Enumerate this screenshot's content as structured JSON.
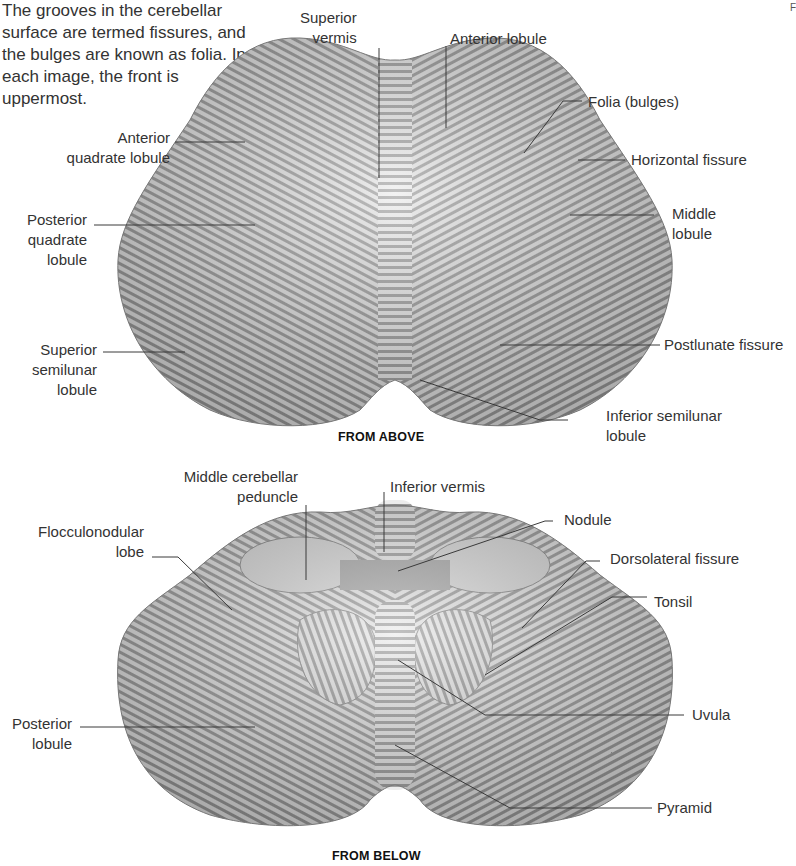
{
  "intro_text": "The grooves in the cerebellar surface are termed fissures, and the bulges are known as folia. In each image, the front is uppermost.",
  "intro_lines": [
    "The grooves in the cerebellar",
    "surface are termed fissures, and",
    "the bulges are known as folia. In",
    "each image, the front is",
    "uppermost."
  ],
  "corner_mark": "F",
  "from_above": {
    "caption": "FROM ABOVE",
    "labels": {
      "superior_vermis": [
        "Superior",
        "vermis"
      ],
      "anterior_lobule": "Anterior lobule",
      "folia": "Folia (bulges)",
      "horizontal_fissure": "Horizontal fissure",
      "middle_lobule": [
        "Middle",
        "lobule"
      ],
      "postlunate_fissure": "Postlunate fissure",
      "inferior_semilunar_lobule": [
        "Inferior semilunar",
        "lobule"
      ],
      "anterior_quadrate_lobule": [
        "Anterior",
        "quadrate lobule"
      ],
      "posterior_quadrate_lobule": [
        "Posterior",
        "quadrate",
        "lobule"
      ],
      "superior_semilunar_lobule": [
        "Superior",
        "semilunar",
        "lobule"
      ]
    }
  },
  "from_below": {
    "caption": "FROM BELOW",
    "labels": {
      "middle_cerebellar_peduncle": [
        "Middle cerebellar",
        "peduncle"
      ],
      "inferior_vermis": "Inferior vermis",
      "flocculonodular_lobe": [
        "Flocculonodular",
        "lobe"
      ],
      "nodule": "Nodule",
      "dorsolateral_fissure": "Dorsolateral fissure",
      "tonsil": "Tonsil",
      "uvula": "Uvula",
      "posterior_lobule": [
        "Posterior",
        "lobule"
      ],
      "pyramid": "Pyramid"
    }
  },
  "colors": {
    "leader_line": "#3a3a3a",
    "tissue_light": "#e6e6e6",
    "tissue_dark": "#8a8a8a",
    "cut_surface": "#d9d9d9"
  }
}
